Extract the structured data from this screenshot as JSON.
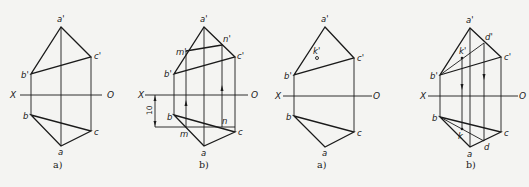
{
  "figures": [
    {
      "caption": "a)",
      "axis": {
        "left": "X",
        "right": "O"
      },
      "labels": {
        "a_prime": "a'",
        "b_prime": "b'",
        "c_prime": "c'",
        "a": "a",
        "b": "b",
        "c": "c"
      }
    },
    {
      "caption": "b)",
      "axis": {
        "left": "X",
        "right": "O"
      },
      "labels": {
        "a_prime": "a'",
        "b_prime": "b'",
        "c_prime": "c'",
        "m_prime": "m'",
        "n_prime": "n'",
        "a": "a",
        "b": "b",
        "c": "c",
        "m": "m",
        "n": "n"
      },
      "dimension": "10"
    },
    {
      "caption": "a)",
      "axis": {
        "left": "X",
        "right": "O"
      },
      "labels": {
        "a_prime": "a'",
        "b_prime": "b'",
        "c_prime": "c'",
        "k_prime": "k'",
        "a": "a",
        "b": "b",
        "c": "c"
      }
    },
    {
      "caption": "b)",
      "axis": {
        "left": "X",
        "right": "O"
      },
      "labels": {
        "a_prime": "a'",
        "b_prime": "b'",
        "c_prime": "c'",
        "d_prime": "d'",
        "k_prime": "k'",
        "a": "a",
        "b": "b",
        "c": "c",
        "d": "d",
        "k": "k"
      }
    }
  ]
}
